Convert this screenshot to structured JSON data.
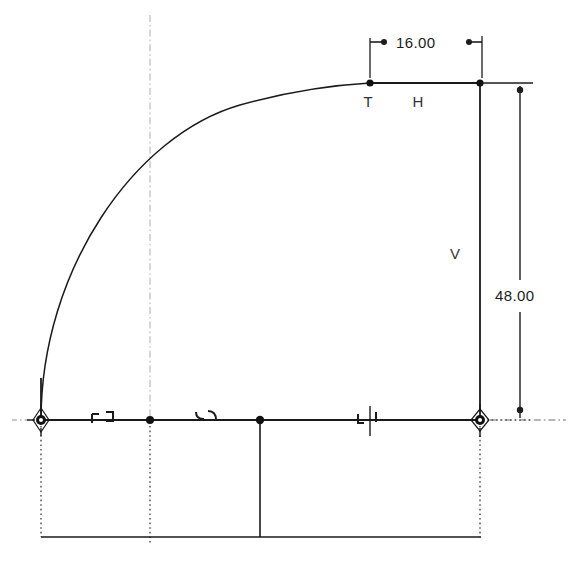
{
  "drawing": {
    "title": "Parametric sketch profile",
    "background_color": "#ffffff",
    "geometry_color": "#1a1a1a",
    "construction_color": "#9a9a9a",
    "dimension_color": "#1c1c1c",
    "constraint_color": "#33333a"
  },
  "dimensions": [
    {
      "id": "horizontal-dimension",
      "label": "16.00",
      "value": 16.0,
      "orientation": "horizontal",
      "text_x": 397,
      "text_y": 48,
      "line_y": 42,
      "from_x": 370,
      "to_x": 485,
      "ext_from_x": 370,
      "ext_to_x": 482,
      "ext_top_y": 42,
      "ext_bottom_y": 88
    },
    {
      "id": "vertical-dimension",
      "label": "48.00",
      "value": 48.0,
      "orientation": "vertical",
      "text_x": 496,
      "text_y": 301,
      "line_x": 520,
      "from_y": 85,
      "to_y": 418,
      "ext_top_y": 83,
      "ext_bottom_y": 420,
      "ext_from_x": 481,
      "ext_to_x": 532
    }
  ],
  "constraint_labels": [
    {
      "id": "tangent-constraint-label",
      "text": "T",
      "x": 368,
      "y": 106,
      "meaning": "tangent"
    },
    {
      "id": "horizontal-constraint-label",
      "text": "H",
      "x": 417,
      "y": 106,
      "meaning": "horizontal"
    },
    {
      "id": "vertical-constraint-label",
      "text": "V",
      "x": 455,
      "y": 259,
      "meaning": "vertical"
    }
  ],
  "points": [
    {
      "id": "origin-point",
      "x": 41,
      "y": 420,
      "kind": "origin-anchor"
    },
    {
      "id": "midline-point",
      "x": 150,
      "y": 420,
      "kind": "construction-point"
    },
    {
      "id": "interior-point",
      "x": 260,
      "y": 420,
      "kind": "sketch-point"
    },
    {
      "id": "right-base-point",
      "x": 480,
      "y": 420,
      "kind": "anchor-point"
    },
    {
      "id": "top-right-point",
      "x": 480,
      "y": 83,
      "kind": "sketch-point"
    },
    {
      "id": "arc-top-point",
      "x": 370,
      "y": 83,
      "kind": "sketch-point"
    }
  ],
  "edges": [
    {
      "id": "top-horizontal-edge",
      "type": "line",
      "x1": 370,
      "y1": 83,
      "x2": 480,
      "y2": 83
    },
    {
      "id": "right-vertical-edge",
      "type": "line",
      "x1": 480,
      "y1": 83,
      "x2": 480,
      "y2": 420
    },
    {
      "id": "base-horizontal-edge",
      "type": "line",
      "x1": 41,
      "y1": 420,
      "x2": 480,
      "y2": 420
    },
    {
      "id": "left-vertical-stub-edge",
      "type": "line",
      "x1": 41,
      "y1": 378,
      "x2": 41,
      "y2": 420
    },
    {
      "id": "profile-arc",
      "type": "arc",
      "from_x": 41,
      "from_y": 420,
      "to_x": 370,
      "to_y": 83
    },
    {
      "id": "interior-vertical-edge",
      "type": "line",
      "x1": 260,
      "y1": 420,
      "x2": 260,
      "y2": 537
    },
    {
      "id": "bottom-horizontal-edge",
      "type": "line",
      "x1": 41,
      "y1": 537,
      "x2": 480,
      "y2": 537
    }
  ],
  "construction_lines": [
    {
      "id": "vertical-centerline",
      "style": "dash-dot",
      "x1": 150,
      "y1": 15,
      "x2": 150,
      "y2": 420
    },
    {
      "id": "horizontal-centerline-right",
      "style": "dash-dot",
      "x1": 490,
      "y1": 420,
      "x2": 566,
      "y2": 420
    },
    {
      "id": "horizontal-centerline-left",
      "style": "dash-dot",
      "x1": 14,
      "y1": 420,
      "x2": 34,
      "y2": 420
    },
    {
      "id": "origin-dotted-drop",
      "style": "dotted",
      "x1": 41,
      "y1": 424,
      "x2": 41,
      "y2": 537
    },
    {
      "id": "midline-dotted-drop",
      "style": "dotted",
      "x1": 150,
      "y1": 424,
      "x2": 150,
      "y2": 542
    },
    {
      "id": "right-dotted-drop",
      "style": "dotted",
      "x1": 480,
      "y1": 424,
      "x2": 480,
      "y2": 537
    }
  ],
  "constraint_glyphs": [
    {
      "id": "origin-fix-constraint",
      "x": 41,
      "y": 420,
      "glyph": "fix-anchor-icon"
    },
    {
      "id": "coincident-pair-left",
      "x": 106,
      "y": 417,
      "glyph": "coincident-pair-icon"
    },
    {
      "id": "coincident-pair-mid",
      "x": 210,
      "y": 417,
      "glyph": "coincident-pair-icon"
    },
    {
      "id": "midpoint-constraint",
      "x": 370,
      "y": 420,
      "glyph": "midpoint-icon"
    },
    {
      "id": "right-fix-constraint",
      "x": 480,
      "y": 420,
      "glyph": "fix-anchor-icon"
    }
  ]
}
